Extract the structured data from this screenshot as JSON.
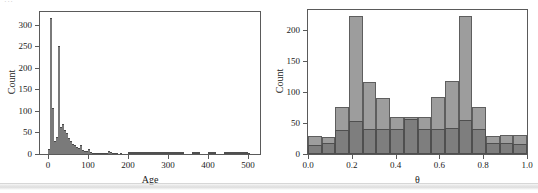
{
  "figure": {
    "scan_artifact_text": "···",
    "background_color": "#ffffff",
    "frame_color": "#5a5a5a"
  },
  "colors": {
    "series_a": "#9d9d9d",
    "series_b": "#7e7e7e",
    "outline": "#5a5a5a",
    "text": "#1a1a1a"
  },
  "chart_data": [
    {
      "type": "bar",
      "id": "age-histogram",
      "title": "",
      "xlabel": "Age",
      "ylabel": "Count",
      "xlim": [
        -20,
        530
      ],
      "ylim": [
        0,
        330
      ],
      "xticks": [
        0,
        100,
        200,
        300,
        400,
        500
      ],
      "xticklabels": [
        "0",
        "100",
        "200",
        "300",
        "400",
        "500"
      ],
      "yticks": [
        0,
        50,
        100,
        150,
        200,
        250,
        300
      ],
      "yticklabels": [
        "0",
        "50",
        "100",
        "150",
        "200",
        "250",
        "300"
      ],
      "grid": false,
      "legend": "none",
      "bin_width": 5,
      "bin_starts": [
        0,
        5,
        10,
        15,
        20,
        25,
        30,
        35,
        40,
        45,
        50,
        55,
        60,
        65,
        70,
        75,
        80,
        85,
        90,
        95,
        100,
        105,
        110,
        115,
        120,
        125,
        130,
        135,
        140,
        145,
        150,
        155,
        160,
        165,
        170,
        175,
        180,
        185,
        190,
        195,
        200,
        210,
        220,
        230,
        240,
        250,
        260,
        270,
        280,
        300,
        320,
        340,
        360,
        380,
        400,
        420,
        440,
        460,
        480,
        500
      ],
      "values": [
        12,
        315,
        108,
        30,
        40,
        250,
        62,
        70,
        55,
        48,
        38,
        30,
        24,
        20,
        16,
        14,
        22,
        10,
        8,
        6,
        12,
        4,
        3,
        2,
        3,
        2,
        2,
        1,
        2,
        1,
        8,
        5,
        2,
        1,
        1,
        0,
        1,
        0,
        0,
        0,
        3,
        2,
        1,
        2,
        1,
        2,
        1,
        1,
        2,
        1,
        1,
        0,
        1,
        0,
        1,
        0,
        1,
        2,
        1,
        1
      ]
    },
    {
      "type": "bar",
      "id": "theta-histogram",
      "title": "",
      "xlabel": "θ",
      "ylabel": "Count",
      "xlim": [
        0.0,
        1.0
      ],
      "ylim": [
        0,
        232
      ],
      "xticks": [
        0.0,
        0.2,
        0.4,
        0.6,
        0.8,
        1.0
      ],
      "xticklabels": [
        "0.0",
        "0.2",
        "0.4",
        "0.6",
        "0.8",
        "1.0"
      ],
      "yticks": [
        0,
        50,
        100,
        150,
        200
      ],
      "yticklabels": [
        "0",
        "50",
        "100",
        "150",
        "200"
      ],
      "grid": false,
      "legend": "none",
      "overlap": "overlaid",
      "bin_width": 0.0625,
      "bin_starts": [
        0.0,
        0.0625,
        0.125,
        0.1875,
        0.25,
        0.3125,
        0.375,
        0.4375,
        0.5,
        0.5625,
        0.625,
        0.6875,
        0.75,
        0.8125,
        0.875,
        0.9375
      ],
      "series": [
        {
          "name": "Series A",
          "color": "#9d9d9d",
          "values": [
            29,
            27,
            75,
            222,
            116,
            91,
            59,
            59,
            59,
            92,
            117,
            222,
            76,
            29,
            30,
            30
          ]
        },
        {
          "name": "Series B",
          "color": "#7e7e7e",
          "values": [
            15,
            18,
            38,
            53,
            41,
            40,
            41,
            56,
            41,
            41,
            42,
            54,
            40,
            18,
            17,
            16
          ]
        }
      ]
    }
  ]
}
